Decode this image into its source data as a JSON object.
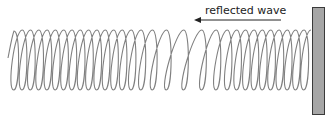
{
  "diagram": {
    "type": "spring-wave",
    "label": "reflected wave",
    "arrow_direction": "left",
    "colors": {
      "spring": "#808080",
      "wall_fill": "#a6a6a6",
      "wall_stroke": "#3a3a3a",
      "arrow": "#222222",
      "text": "#222222"
    }
  }
}
